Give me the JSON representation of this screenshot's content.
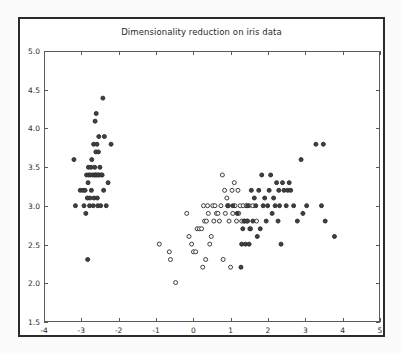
{
  "chart_data": {
    "type": "scatter",
    "title": "Dimensionality reduction on iris data",
    "xlabel": "",
    "ylabel": "",
    "xlim": [
      -4,
      5
    ],
    "ylim": [
      1.5,
      5.0
    ],
    "xticks": [
      -4,
      -3,
      -2,
      -1,
      0,
      1,
      2,
      3,
      4,
      5
    ],
    "xticklabels": [
      "-4",
      "-3",
      "-2",
      "-1",
      "0",
      "1",
      "2",
      "3",
      "4",
      "5"
    ],
    "yticks": [
      1.5,
      2.0,
      2.5,
      3.0,
      3.5,
      4.0,
      4.5,
      5.0
    ],
    "yticklabels": [
      "1.5",
      "2.0",
      "2.5",
      "3.0",
      "3.5",
      "4.0",
      "4.5",
      "5.0"
    ],
    "grid": false,
    "legend": null,
    "marker_size_px": 4,
    "series": [
      {
        "name": "cluster-left-filled",
        "marker": "filled-circle",
        "color": "#404040",
        "edge_color": "#303030",
        "points": [
          [
            -3.22,
            3.6
          ],
          [
            -3.18,
            3.0
          ],
          [
            -3.05,
            3.2
          ],
          [
            -2.98,
            3.2
          ],
          [
            -2.95,
            3.0
          ],
          [
            -2.92,
            3.2
          ],
          [
            -2.9,
            2.9
          ],
          [
            -2.88,
            3.4
          ],
          [
            -2.86,
            3.1
          ],
          [
            -2.84,
            3.3
          ],
          [
            -2.83,
            3.5
          ],
          [
            -2.82,
            3.4
          ],
          [
            -2.8,
            3.0
          ],
          [
            -2.79,
            3.1
          ],
          [
            -2.78,
            3.4
          ],
          [
            -2.76,
            3.5
          ],
          [
            -2.75,
            3.2
          ],
          [
            -2.74,
            3.6
          ],
          [
            -2.72,
            3.4
          ],
          [
            -2.7,
            3.0
          ],
          [
            -2.69,
            3.8
          ],
          [
            -2.68,
            3.1
          ],
          [
            -2.67,
            3.4
          ],
          [
            -2.66,
            3.5
          ],
          [
            -2.65,
            4.1
          ],
          [
            -2.64,
            3.4
          ],
          [
            -2.63,
            3.7
          ],
          [
            -2.62,
            4.2
          ],
          [
            -2.61,
            3.4
          ],
          [
            -2.6,
            3.8
          ],
          [
            -2.59,
            3.1
          ],
          [
            -2.58,
            3.0
          ],
          [
            -2.57,
            3.4
          ],
          [
            -2.56,
            3.7
          ],
          [
            -2.55,
            3.9
          ],
          [
            -2.54,
            3.4
          ],
          [
            -2.52,
            3.5
          ],
          [
            -2.5,
            3.0
          ],
          [
            -2.48,
            3.4
          ],
          [
            -2.46,
            3.4
          ],
          [
            -2.44,
            4.4
          ],
          [
            -2.42,
            3.2
          ],
          [
            -2.4,
            3.9
          ],
          [
            -2.35,
            3.0
          ],
          [
            -2.3,
            3.3
          ],
          [
            -2.22,
            3.8
          ],
          [
            -2.85,
            2.3
          ]
        ]
      },
      {
        "name": "cluster-middle-hollow",
        "marker": "open-circle",
        "color": "#ffffff",
        "edge_color": "#3a3a3a",
        "points": [
          [
            -0.92,
            2.5
          ],
          [
            -0.65,
            2.4
          ],
          [
            -0.62,
            2.3
          ],
          [
            -0.48,
            2.0
          ],
          [
            -0.18,
            2.9
          ],
          [
            -0.12,
            2.6
          ],
          [
            -0.05,
            2.5
          ],
          [
            0.0,
            2.4
          ],
          [
            0.06,
            2.4
          ],
          [
            0.1,
            2.7
          ],
          [
            0.16,
            2.7
          ],
          [
            0.22,
            2.7
          ],
          [
            0.25,
            2.2
          ],
          [
            0.27,
            3.0
          ],
          [
            0.3,
            2.8
          ],
          [
            0.33,
            2.3
          ],
          [
            0.35,
            2.8
          ],
          [
            0.38,
            3.0
          ],
          [
            0.4,
            2.9
          ],
          [
            0.44,
            2.5
          ],
          [
            0.48,
            2.6
          ],
          [
            0.52,
            3.0
          ],
          [
            0.55,
            2.8
          ],
          [
            0.58,
            3.0
          ],
          [
            0.62,
            2.9
          ],
          [
            0.66,
            2.9
          ],
          [
            0.7,
            2.8
          ],
          [
            0.74,
            3.0
          ],
          [
            0.78,
            3.4
          ],
          [
            0.8,
            2.3
          ],
          [
            0.84,
            3.2
          ],
          [
            0.86,
            2.9
          ],
          [
            0.9,
            3.1
          ],
          [
            0.94,
            3.0
          ],
          [
            0.96,
            2.8
          ],
          [
            1.0,
            2.2
          ],
          [
            1.04,
            3.2
          ],
          [
            1.06,
            2.9
          ],
          [
            1.1,
            3.3
          ],
          [
            1.12,
            3.0
          ],
          [
            1.16,
            2.8
          ],
          [
            1.2,
            3.2
          ],
          [
            1.22,
            2.9
          ],
          [
            1.26,
            3.0
          ],
          [
            1.3,
            2.8
          ],
          [
            1.34,
            3.0
          ],
          [
            1.38,
            2.8
          ],
          [
            1.42,
            3.0
          ],
          [
            1.46,
            2.8
          ],
          [
            1.5,
            3.0
          ],
          [
            1.54,
            2.7
          ],
          [
            1.6,
            3.0
          ],
          [
            1.7,
            2.8
          ]
        ]
      },
      {
        "name": "cluster-right-filled",
        "marker": "filled-circle",
        "color": "#404040",
        "edge_color": "#303030",
        "points": [
          [
            0.92,
            3.0
          ],
          [
            1.06,
            3.0
          ],
          [
            1.18,
            2.9
          ],
          [
            1.3,
            2.5
          ],
          [
            1.33,
            2.7
          ],
          [
            1.36,
            2.8
          ],
          [
            1.4,
            2.5
          ],
          [
            1.44,
            2.8
          ],
          [
            1.46,
            3.0
          ],
          [
            1.5,
            2.5
          ],
          [
            1.52,
            2.7
          ],
          [
            1.56,
            3.2
          ],
          [
            1.6,
            2.8
          ],
          [
            1.64,
            3.1
          ],
          [
            1.68,
            3.0
          ],
          [
            1.72,
            2.6
          ],
          [
            1.76,
            3.2
          ],
          [
            1.8,
            2.7
          ],
          [
            1.84,
            3.4
          ],
          [
            1.88,
            3.0
          ],
          [
            1.92,
            3.1
          ],
          [
            1.96,
            2.8
          ],
          [
            2.0,
            3.0
          ],
          [
            2.04,
            3.2
          ],
          [
            2.08,
            3.4
          ],
          [
            2.12,
            2.9
          ],
          [
            2.16,
            3.1
          ],
          [
            2.2,
            3.0
          ],
          [
            2.24,
            3.3
          ],
          [
            2.28,
            2.8
          ],
          [
            2.3,
            3.2
          ],
          [
            2.32,
            3.0
          ],
          [
            2.36,
            2.5
          ],
          [
            2.4,
            3.3
          ],
          [
            2.44,
            3.2
          ],
          [
            2.5,
            3.0
          ],
          [
            2.54,
            3.2
          ],
          [
            2.58,
            3.3
          ],
          [
            2.62,
            3.2
          ],
          [
            2.7,
            3.0
          ],
          [
            2.8,
            2.8
          ],
          [
            2.9,
            3.6
          ],
          [
            2.95,
            2.9
          ],
          [
            3.05,
            3.0
          ],
          [
            3.3,
            3.8
          ],
          [
            3.45,
            3.0
          ],
          [
            3.5,
            3.8
          ],
          [
            3.55,
            2.8
          ],
          [
            3.8,
            2.6
          ],
          [
            1.28,
            2.2
          ]
        ]
      }
    ]
  }
}
